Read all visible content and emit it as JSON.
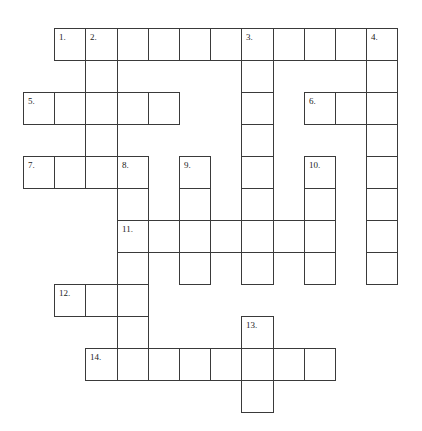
{
  "puzzle": {
    "type": "crossword",
    "grid_geometry": {
      "origin_x": 23,
      "origin_y": 28,
      "cell_w": 31.2,
      "cell_h": 32
    },
    "clue_numbers": [
      "1.",
      "2.",
      "3.",
      "4.",
      "5.",
      "6.",
      "7.",
      "8.",
      "9.",
      "10.",
      "11.",
      "12.",
      "13.",
      "14."
    ],
    "words": [
      {
        "number": "1.",
        "direction": "across",
        "row": 0,
        "col": 1,
        "length": 11
      },
      {
        "number": "2.",
        "direction": "down",
        "row": 0,
        "col": 2,
        "length": 5
      },
      {
        "number": "3.",
        "direction": "down",
        "row": 0,
        "col": 7,
        "length": 8
      },
      {
        "number": "4.",
        "direction": "down",
        "row": 0,
        "col": 11,
        "length": 8
      },
      {
        "number": "5.",
        "direction": "across",
        "row": 2,
        "col": 0,
        "length": 5
      },
      {
        "number": "6.",
        "direction": "across",
        "row": 2,
        "col": 9,
        "length": 3
      },
      {
        "number": "7.",
        "direction": "across",
        "row": 4,
        "col": 0,
        "length": 4
      },
      {
        "number": "8.",
        "direction": "down",
        "row": 4,
        "col": 3,
        "length": 7
      },
      {
        "number": "9.",
        "direction": "down",
        "row": 4,
        "col": 5,
        "length": 4
      },
      {
        "number": "10.",
        "direction": "down",
        "row": 4,
        "col": 9,
        "length": 4
      },
      {
        "number": "11.",
        "direction": "across",
        "row": 6,
        "col": 3,
        "length": 7
      },
      {
        "number": "12.",
        "direction": "across",
        "row": 8,
        "col": 1,
        "length": 3
      },
      {
        "number": "13.",
        "direction": "down",
        "row": 9,
        "col": 7,
        "length": 3
      },
      {
        "number": "14.",
        "direction": "across",
        "row": 10,
        "col": 2,
        "length": 8
      }
    ],
    "colors": {
      "border": "#3a3a3a",
      "cell_fill": "#ffffff",
      "number_text": "#222222"
    }
  }
}
